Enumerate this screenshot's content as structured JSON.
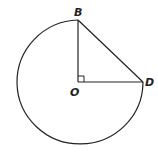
{
  "diagram": {
    "type": "circle-sector",
    "points": {
      "B": {
        "label": "B",
        "x": 78,
        "y": 20
      },
      "O": {
        "label": "O",
        "x": 78,
        "y": 82
      },
      "D": {
        "label": "D",
        "x": 143,
        "y": 82
      }
    },
    "right_angle_at": "O",
    "stroke_color": "#222222"
  }
}
